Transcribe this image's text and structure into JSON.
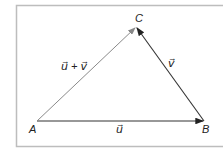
{
  "diagram": {
    "title": "",
    "points": {
      "A": {
        "label": "A",
        "x": 37,
        "y": 121
      },
      "B": {
        "label": "B",
        "x": 204,
        "y": 121
      },
      "C": {
        "label": "C",
        "x": 136,
        "y": 27
      }
    },
    "vectors": [
      {
        "from": "A",
        "to": "B",
        "label": "u⃗",
        "text": "u"
      },
      {
        "from": "B",
        "to": "C",
        "label": "v⃗",
        "text": "v"
      },
      {
        "from": "A",
        "to": "C",
        "label": "u⃗ + v⃗",
        "text": "u + v"
      }
    ],
    "colors": {
      "frame": "#bdbdbd",
      "ab": "#333333",
      "bc": "#333333",
      "ac": "#8a8a8a"
    }
  }
}
